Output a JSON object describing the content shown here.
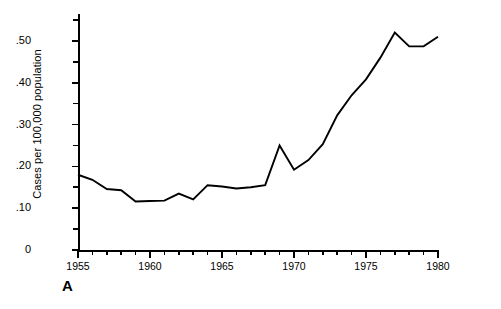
{
  "figure": {
    "panel_letter": "A",
    "background_color": "#ffffff",
    "line_color": "#000000"
  },
  "axes": {
    "y_title": "Cases per 100,000 population",
    "y_tick_labels": [
      "0",
      ".10",
      ".20",
      ".30",
      ".40",
      ".50"
    ],
    "y_tick_values": [
      0,
      0.1,
      0.2,
      0.3,
      0.4,
      0.5
    ],
    "x_tick_labels": [
      "1955",
      "1960",
      "1965",
      "1970",
      "1975",
      "1980"
    ],
    "x_tick_values": [
      1955,
      1960,
      1965,
      1970,
      1975,
      1980
    ]
  },
  "chart_data": {
    "type": "line",
    "title": "",
    "subtitle": "",
    "xlabel": "",
    "ylabel": "Cases per 100,000 population",
    "xlim": [
      1955,
      1980
    ],
    "ylim": [
      0,
      0.55
    ],
    "grid": false,
    "legend": null,
    "annotations": [
      {
        "text": "A",
        "position": "bottom-left",
        "role": "panel-label"
      }
    ],
    "x": [
      1955,
      1956,
      1957,
      1958,
      1959,
      1960,
      1961,
      1962,
      1963,
      1964,
      1965,
      1966,
      1967,
      1968,
      1969,
      1970,
      1971,
      1972,
      1973,
      1974,
      1975,
      1976,
      1977,
      1978,
      1979,
      1980
    ],
    "series": [
      {
        "name": "Cases per 100,000 population",
        "values": [
          0.18,
          0.168,
          0.146,
          0.143,
          0.116,
          0.117,
          0.118,
          0.135,
          0.121,
          0.155,
          0.152,
          0.147,
          0.15,
          0.155,
          0.25,
          0.192,
          0.215,
          0.253,
          0.322,
          0.37,
          0.408,
          0.46,
          0.52,
          0.487,
          0.487,
          0.51
        ]
      }
    ]
  }
}
